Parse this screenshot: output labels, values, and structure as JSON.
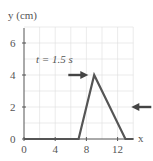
{
  "chart_data": {
    "type": "line",
    "title": "",
    "annotation": "t = 1.5 s",
    "xlabel": "x",
    "ylabel": "y (cm)",
    "xlim": [
      0,
      14
    ],
    "ylim": [
      0,
      7
    ],
    "x_ticks": [
      "0",
      "4",
      "8",
      "12"
    ],
    "y_ticks": [
      "0",
      "2",
      "4",
      "6"
    ],
    "grid": true,
    "series": [
      {
        "name": "pulse",
        "x": [
          0,
          7,
          9,
          13,
          14
        ],
        "y": [
          0,
          0,
          4,
          0,
          0
        ]
      }
    ],
    "arrows": [
      {
        "direction": "right",
        "at": [
          8.5,
          4
        ]
      },
      {
        "direction": "left",
        "at": [
          13.5,
          2
        ]
      }
    ]
  }
}
